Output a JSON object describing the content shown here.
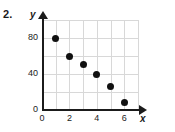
{
  "problem": {
    "number": "2."
  },
  "chart_data": {
    "type": "scatter",
    "title": "",
    "xlabel": "x",
    "ylabel": "y",
    "xlim": [
      0,
      7
    ],
    "ylim": [
      0,
      100
    ],
    "grid": true,
    "legend": null,
    "x_ticks": [
      "0",
      "2",
      "4",
      "6"
    ],
    "x_tick_values": [
      0,
      2,
      4,
      6
    ],
    "y_ticks": [
      "0",
      "40",
      "80"
    ],
    "y_tick_values": [
      0,
      40,
      80
    ],
    "x_gridlines": [
      0,
      1,
      2,
      3,
      4,
      5,
      6,
      7
    ],
    "y_gridlines": [
      0,
      20,
      40,
      60,
      80,
      100
    ],
    "point_color": "#111111",
    "grid_color": "#d8d8d8",
    "axis_color": "#1b1b1b",
    "points": [
      {
        "x": 1,
        "y": 80
      },
      {
        "x": 2,
        "y": 60
      },
      {
        "x": 3,
        "y": 51
      },
      {
        "x": 4,
        "y": 39
      },
      {
        "x": 5,
        "y": 26
      },
      {
        "x": 6,
        "y": 8
      }
    ]
  }
}
